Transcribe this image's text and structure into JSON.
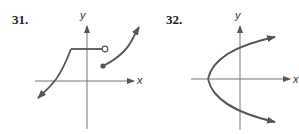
{
  "figures": [
    {
      "number": "31.",
      "x_axis_label": "x",
      "y_axis_label": "y",
      "description": "Piecewise graph: curve rising from lower-left arrow to a horizontal segment ending in an open circle; separate piece starting at a closed dot and rising to upper-right arrow"
    },
    {
      "number": "32.",
      "x_axis_label": "x",
      "y_axis_label": "y",
      "description": "Sideways parabola opening to the right with vertex on the negative x-axis, arrows on both ends"
    }
  ],
  "colors": {
    "curve": "#555555",
    "axis": "#666666",
    "text": "#222222"
  }
}
